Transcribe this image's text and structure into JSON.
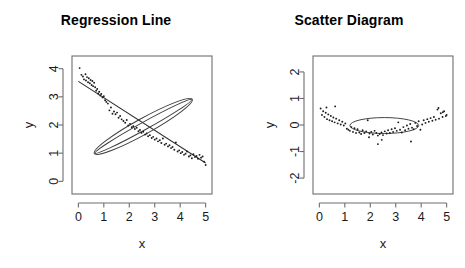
{
  "figure": {
    "background": "#ffffff",
    "point_color": "#1c1c1c",
    "line_color": "#2b2b2b",
    "axis_color": "#6e6e6e",
    "width": 465,
    "height": 268
  },
  "panels": [
    {
      "id": "regression-line",
      "title": "Regression Line",
      "xlabel": "x",
      "ylabel": "y"
    },
    {
      "id": "scatter-diagram",
      "title": "Scatter Diagram",
      "xlabel": "x",
      "ylabel": "y"
    }
  ],
  "chart_data": [
    {
      "type": "scatter",
      "title": "Regression Line",
      "xlabel": "x",
      "ylabel": "y",
      "xlim": [
        -0.25,
        5.25
      ],
      "ylim": [
        -0.45,
        4.45
      ],
      "xticks": [
        0,
        1,
        2,
        3,
        4,
        5
      ],
      "yticks": [
        0,
        1,
        2,
        3,
        4
      ],
      "xticklabels": [
        "0",
        "1",
        "2",
        "3",
        "4",
        "5"
      ],
      "yticklabels": [
        "0",
        "1",
        "2",
        "3",
        "4"
      ],
      "grid": false,
      "legend": null,
      "series": [
        {
          "name": "observations",
          "marker": "point",
          "x": [
            0.05,
            0.12,
            0.18,
            0.22,
            0.28,
            0.3,
            0.34,
            0.38,
            0.41,
            0.45,
            0.48,
            0.52,
            0.55,
            0.58,
            0.62,
            0.66,
            0.7,
            0.74,
            0.78,
            0.82,
            0.86,
            0.9,
            0.95,
            1.0,
            1.05,
            1.1,
            1.16,
            1.22,
            1.28,
            1.34,
            1.4,
            1.46,
            1.52,
            1.58,
            1.64,
            1.7,
            1.77,
            1.84,
            1.9,
            1.96,
            2.03,
            2.1,
            2.16,
            2.22,
            2.29,
            2.36,
            2.42,
            2.48,
            2.55,
            2.62,
            2.68,
            2.74,
            2.81,
            2.88,
            2.94,
            3.0,
            3.07,
            3.13,
            3.2,
            3.26,
            3.32,
            3.39,
            3.45,
            3.52,
            3.58,
            3.64,
            3.7,
            3.77,
            3.83,
            3.9,
            3.96,
            4.02,
            4.08,
            4.15,
            4.21,
            4.27,
            4.34,
            4.4,
            4.46,
            4.52,
            4.58,
            4.64,
            4.7,
            4.76,
            4.82,
            4.88,
            4.94,
            5.0
          ],
          "y": [
            4.02,
            3.78,
            3.72,
            3.62,
            3.8,
            3.58,
            3.7,
            3.52,
            3.66,
            3.48,
            3.6,
            3.42,
            3.56,
            3.38,
            3.5,
            3.34,
            3.22,
            3.28,
            3.12,
            3.18,
            3.05,
            3.1,
            2.98,
            3.02,
            2.88,
            2.82,
            2.76,
            2.52,
            2.62,
            2.4,
            2.48,
            2.38,
            2.44,
            2.26,
            2.32,
            2.2,
            2.14,
            2.08,
            2.18,
            1.98,
            2.04,
            1.92,
            1.96,
            1.86,
            1.9,
            1.78,
            1.82,
            1.72,
            1.76,
            1.66,
            1.7,
            1.6,
            1.64,
            1.54,
            1.58,
            1.48,
            1.52,
            1.42,
            1.46,
            1.36,
            1.52,
            1.3,
            1.34,
            1.24,
            1.28,
            1.18,
            1.22,
            1.12,
            1.38,
            1.06,
            1.1,
            1.0,
            1.04,
            0.94,
            0.98,
            1.06,
            0.88,
            0.92,
            0.82,
            0.96,
            0.86,
            0.9,
            0.8,
            0.94,
            0.84,
            0.88,
            0.7,
            0.58
          ]
        }
      ],
      "fit_line": {
        "name": "least-squares regression line",
        "intercept": 3.55,
        "slope": -0.58,
        "x_range": [
          0.0,
          5.0
        ]
      },
      "overlay": {
        "name": "confidence-band ellipse",
        "shape": "ellipse",
        "center_x": 2.55,
        "center_y": 1.95,
        "semi_major": 2.2,
        "semi_minor": 0.28,
        "rotation_deg": -29
      }
    },
    {
      "type": "scatter",
      "title": "Scatter Diagram",
      "xlabel": "x",
      "ylabel": "y",
      "xlim": [
        -0.25,
        5.25
      ],
      "ylim": [
        -2.6,
        2.6
      ],
      "xticks": [
        0,
        1,
        2,
        3,
        4,
        5
      ],
      "yticks": [
        -2,
        -1,
        0,
        1,
        2
      ],
      "xticklabels": [
        "0",
        "1",
        "2",
        "3",
        "4",
        "5"
      ],
      "yticklabels": [
        "-2",
        "-1",
        "0",
        "1",
        "2"
      ],
      "grid": false,
      "legend": null,
      "series": [
        {
          "name": "residuals",
          "marker": "point",
          "x": [
            0.05,
            0.1,
            0.15,
            0.2,
            0.25,
            0.3,
            0.35,
            0.4,
            0.45,
            0.5,
            0.55,
            0.6,
            0.66,
            0.72,
            0.78,
            0.84,
            0.9,
            0.96,
            1.02,
            1.08,
            1.14,
            1.2,
            1.26,
            1.32,
            1.38,
            1.44,
            1.5,
            1.57,
            1.64,
            1.7,
            1.77,
            1.84,
            1.9,
            1.97,
            2.04,
            2.1,
            2.17,
            2.24,
            2.3,
            2.37,
            2.44,
            2.5,
            2.57,
            2.64,
            2.7,
            2.77,
            2.84,
            2.9,
            2.97,
            3.04,
            3.1,
            3.17,
            3.24,
            3.3,
            3.37,
            3.44,
            3.5,
            3.57,
            3.64,
            3.7,
            3.77,
            3.84,
            3.9,
            3.97,
            4.04,
            4.1,
            4.17,
            4.24,
            4.3,
            4.37,
            4.44,
            4.5,
            4.57,
            4.64,
            4.7,
            4.77,
            4.84,
            4.9,
            4.97,
            5.0,
            2.3,
            2.45,
            1.95,
            3.6,
            0.28,
            0.62,
            4.68,
            4.85
          ],
          "y": [
            0.62,
            0.38,
            0.52,
            0.3,
            0.46,
            0.22,
            0.4,
            0.18,
            0.34,
            0.14,
            0.28,
            0.1,
            0.24,
            0.06,
            0.18,
            0.02,
            0.12,
            -0.02,
            0.06,
            -0.14,
            -0.18,
            -0.22,
            -0.08,
            -0.26,
            -0.12,
            -0.3,
            -0.16,
            -0.28,
            -0.34,
            -0.2,
            -0.3,
            -0.24,
            0.18,
            -0.32,
            -0.26,
            -0.36,
            -0.22,
            -0.3,
            -0.4,
            -0.34,
            -0.28,
            -0.38,
            -0.24,
            -0.32,
            -0.2,
            -0.3,
            -0.16,
            -0.26,
            -0.12,
            -0.22,
            0.1,
            -0.18,
            -0.28,
            -0.08,
            -0.2,
            -0.02,
            -0.14,
            0.04,
            -0.1,
            -0.16,
            0.08,
            -0.04,
            0.14,
            -0.18,
            0.02,
            0.18,
            0.08,
            0.22,
            0.12,
            0.26,
            0.16,
            0.3,
            0.2,
            0.58,
            0.24,
            0.44,
            0.3,
            0.52,
            0.34,
            0.38,
            -0.72,
            -0.56,
            -0.46,
            -0.62,
            0.66,
            0.7,
            0.64,
            0.48
          ]
        }
      ],
      "overlay": {
        "name": "concentration ellipse",
        "shape": "ellipse",
        "center_x": 2.55,
        "center_y": -0.02,
        "semi_major": 1.35,
        "semi_minor": 0.3,
        "rotation_deg": 0
      }
    }
  ]
}
